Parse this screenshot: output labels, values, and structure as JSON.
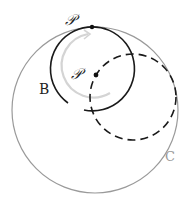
{
  "diagram": {
    "labels": {
      "top_point": "𝒫",
      "center_point": "𝒫",
      "circle_b": "B",
      "circle_c": "C"
    },
    "colors": {
      "circle_c": "#9a9a9a",
      "circle_b": "#1a1a1a",
      "dashed_circle": "#1a1a1a",
      "rotation_arrow": "#d4d4d4",
      "label_c": "#9a9a9a",
      "label_dark": "#222222"
    },
    "circles": [
      {
        "name": "C",
        "cx": 95,
        "cy": 110,
        "r": 83,
        "style": "solid-gray"
      },
      {
        "name": "B",
        "cx": 92,
        "cy": 69,
        "r": 42,
        "style": "solid-black-open-arc"
      },
      {
        "name": "shifted",
        "cx": 133,
        "cy": 97,
        "r": 43,
        "style": "dashed-black"
      }
    ],
    "points": [
      {
        "name": "P-top",
        "x": 92,
        "y": 27
      },
      {
        "name": "P-center",
        "x": 96,
        "y": 75
      }
    ]
  }
}
